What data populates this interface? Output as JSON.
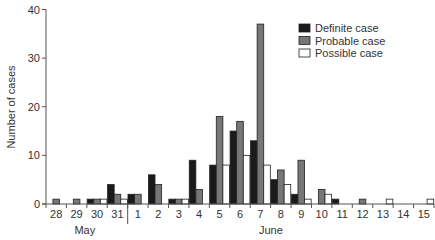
{
  "chart_data": {
    "type": "bar",
    "title": "",
    "xlabel": "",
    "ylabel": "Number of cases",
    "ylim": [
      0,
      40
    ],
    "yticks": [
      0,
      10,
      20,
      30,
      40
    ],
    "categories": [
      "28",
      "29",
      "30",
      "31",
      "1",
      "2",
      "3",
      "4",
      "5",
      "6",
      "7",
      "8",
      "9",
      "10",
      "11",
      "12",
      "13",
      "14",
      "15"
    ],
    "month_groups": [
      {
        "label": "May",
        "start": 0,
        "end": 3
      },
      {
        "label": "June",
        "start": 4,
        "end": 18
      }
    ],
    "series": [
      {
        "name": "Definite case",
        "color": "#1a1a1a",
        "values": [
          0,
          0,
          1,
          4,
          2,
          6,
          1,
          9,
          8,
          15,
          13,
          5,
          2,
          0,
          1,
          0,
          0,
          0,
          0
        ]
      },
      {
        "name": "Probable case",
        "color": "#777777",
        "values": [
          1,
          1,
          1,
          2,
          2,
          4,
          1,
          3,
          18,
          17,
          37,
          7,
          9,
          3,
          0,
          1,
          0,
          0,
          0
        ]
      },
      {
        "name": "Possible case",
        "color": "#ffffff",
        "values": [
          0,
          0,
          1,
          1,
          0,
          0,
          1,
          0,
          8,
          10,
          8,
          4,
          1,
          2,
          0,
          0,
          1,
          0,
          1
        ]
      }
    ],
    "legend_position": "top-right",
    "grid": false
  }
}
